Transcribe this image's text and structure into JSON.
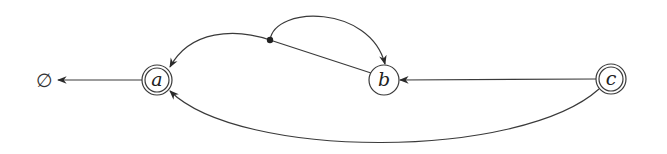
{
  "diagram": {
    "type": "state-automaton",
    "nodes": [
      {
        "id": "a",
        "label": "a",
        "x": 157,
        "y": 80,
        "accepting": true
      },
      {
        "id": "b",
        "label": "b",
        "x": 384,
        "y": 80,
        "accepting": false
      },
      {
        "id": "c",
        "label": "c",
        "x": 611,
        "y": 79,
        "accepting": true
      }
    ],
    "sink": {
      "label": "∅",
      "x": 44,
      "y": 80
    },
    "junction": {
      "x": 270,
      "y": 40
    },
    "edges": [
      {
        "from": "a",
        "to": "sink",
        "label": ""
      },
      {
        "from": "c",
        "to": "b",
        "label": ""
      },
      {
        "from": "c",
        "to": "a",
        "label": "",
        "shape": "arc-below"
      },
      {
        "from": "b",
        "to": "junction",
        "label": "",
        "note": "hyperedge source"
      },
      {
        "from": "junction",
        "to": "a",
        "label": ""
      },
      {
        "from": "junction",
        "to": "b",
        "label": "",
        "shape": "loop-above"
      }
    ],
    "colors": {
      "stroke": "#3a3a3a",
      "background": "#ffffff"
    }
  }
}
